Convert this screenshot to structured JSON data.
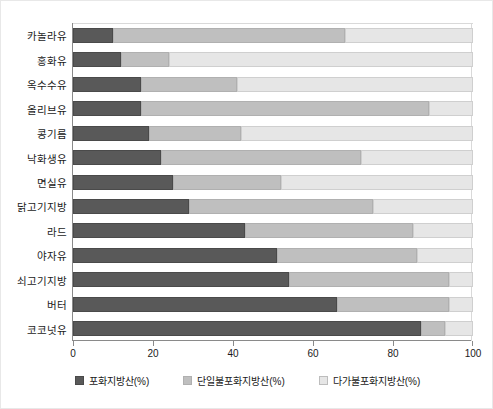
{
  "chart_data": {
    "type": "bar",
    "orientation": "horizontal",
    "stacked": true,
    "title": "",
    "xlabel": "",
    "ylabel": "",
    "xlim": [
      0,
      100
    ],
    "xticks": [
      "0",
      "20",
      "40",
      "60",
      "80",
      "100"
    ],
    "grid": false,
    "legend_position": "bottom",
    "categories": [
      "카놀라유",
      "홍화유",
      "옥수수유",
      "올리브유",
      "콩기름",
      "낙화생유",
      "면실유",
      "닭고기지방",
      "라드",
      "야자유",
      "쇠고기지방",
      "버터",
      "코코넛유"
    ],
    "series": [
      {
        "name": "포화지방산(%)",
        "color": "#595959",
        "values": [
          10,
          12,
          17,
          17,
          19,
          22,
          25,
          29,
          43,
          51,
          54,
          66,
          87
        ]
      },
      {
        "name": "단일불포화지방산(%)",
        "color": "#bfbfbf",
        "values": [
          58,
          12,
          24,
          72,
          23,
          50,
          27,
          46,
          42,
          35,
          40,
          28,
          6
        ]
      },
      {
        "name": "다가불포화지방산(%)",
        "color": "#e6e6e6",
        "values": [
          32,
          76,
          59,
          11,
          58,
          28,
          48,
          25,
          15,
          14,
          6,
          6,
          7
        ]
      }
    ]
  },
  "legend": {
    "items": [
      {
        "label": "포화지방산(%)",
        "swatch": "legend-swatch-saturated"
      },
      {
        "label": "단일불포화지방산(%)",
        "swatch": "legend-swatch-monounsaturated"
      },
      {
        "label": "다가불포화지방산(%)",
        "swatch": "legend-swatch-polyunsaturated"
      }
    ]
  }
}
